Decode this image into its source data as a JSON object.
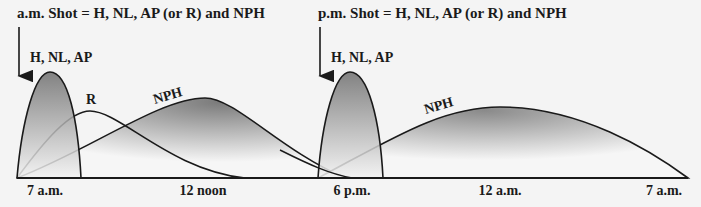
{
  "diagram": {
    "am_shot_title": "a.m. Shot = H, NL, AP (or R) and NPH",
    "pm_shot_title": "p.m. Shot = H, NL, AP (or R) and NPH",
    "curve_labels": {
      "am_rapid": "H, NL, AP",
      "am_regular": "R",
      "am_nph": "NPH",
      "pm_rapid": "H, NL, AP",
      "pm_nph": "NPH"
    },
    "time_axis": [
      "7 a.m.",
      "12 noon",
      "6 p.m.",
      "12 a.m.",
      "7 a.m."
    ],
    "colors": {
      "background": "#f4f4f4",
      "line": "#1a1a1a",
      "fill_dark": "#7a7a7a",
      "fill_light": "#f0f0f0"
    }
  }
}
